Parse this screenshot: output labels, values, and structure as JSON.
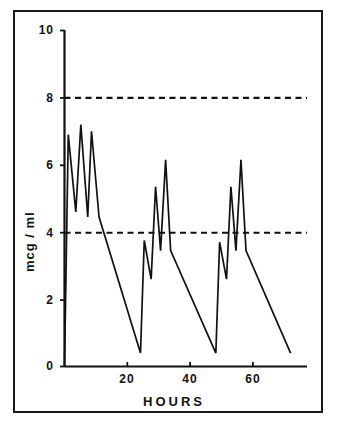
{
  "chart_data": {
    "type": "line",
    "title": "",
    "subtitle": "",
    "xlabel": "HOURS",
    "ylabel": "mcg / ml",
    "xlim": [
      0,
      76
    ],
    "ylim": [
      0,
      10
    ],
    "xticks": [
      20,
      40,
      60
    ],
    "xticklabels": [
      "20",
      "40",
      "60"
    ],
    "yticks": [
      0,
      2,
      4,
      6,
      8,
      10
    ],
    "yticklabels": [
      "0",
      "2",
      "4",
      "6",
      "8",
      "10"
    ],
    "grid": false,
    "legend": "none",
    "line_color": "#111111",
    "frame_color": "#1a1a1a",
    "background": "#ffffff",
    "annotations": [
      {
        "name": "upper-threshold",
        "type": "hline",
        "y": 8,
        "style": "dashed",
        "label": ""
      },
      {
        "name": "lower-threshold",
        "type": "hline",
        "y": 4,
        "style": "dashed",
        "label": ""
      }
    ],
    "series": [
      {
        "name": "serum concentration",
        "x": [
          0.0,
          1.2,
          3.6,
          5.2,
          7.4,
          8.6,
          11.0,
          24.2,
          25.4,
          27.6,
          29.0,
          30.6,
          32.2,
          33.8,
          48.2,
          49.4,
          51.6,
          53.0,
          54.6,
          56.2,
          57.8,
          72.0
        ],
        "y": [
          0.0,
          6.9,
          4.6,
          7.2,
          4.45,
          7.0,
          4.45,
          0.4,
          3.75,
          2.6,
          5.35,
          3.45,
          6.15,
          3.45,
          0.4,
          3.7,
          2.6,
          5.35,
          3.45,
          6.15,
          3.45,
          0.4
        ]
      }
    ]
  },
  "axis": {
    "y_label": "mcg / ml",
    "x_label": "HOURS"
  }
}
